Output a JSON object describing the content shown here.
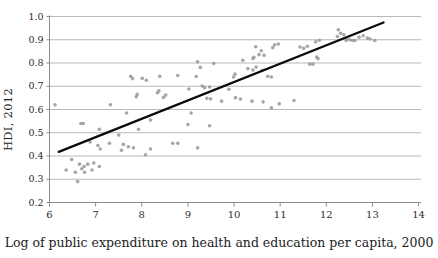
{
  "figure": {
    "background": "#ffffff",
    "text_color": "#1c1c1c"
  },
  "chart_data": {
    "type": "scatter",
    "title": "",
    "xlabel": "Log of public expenditure on health and education per capita, 2000",
    "ylabel": "HDI, 2012",
    "xlim": [
      6,
      14
    ],
    "ylim": [
      0.2,
      1.0
    ],
    "x_ticks": [
      6,
      7,
      8,
      9,
      10,
      11,
      12,
      13,
      14
    ],
    "y_ticks": [
      0.2,
      0.3,
      0.4,
      0.5,
      0.6,
      0.7,
      0.8,
      0.9,
      1.0
    ],
    "grid": "horizontal",
    "legend": "none",
    "point_color": "#9c9c9c",
    "gridline_color": "#b9b9b9",
    "axis_color": "#8c8c8c",
    "trend_color": "#0a0a0a",
    "points": [
      [
        6.12,
        0.62
      ],
      [
        6.36,
        0.34
      ],
      [
        6.48,
        0.385
      ],
      [
        6.56,
        0.33
      ],
      [
        6.61,
        0.29
      ],
      [
        6.65,
        0.365
      ],
      [
        6.7,
        0.345
      ],
      [
        6.75,
        0.355
      ],
      [
        6.76,
        0.33
      ],
      [
        6.83,
        0.365
      ],
      [
        6.92,
        0.34
      ],
      [
        6.96,
        0.37
      ],
      [
        7.08,
        0.355
      ],
      [
        6.68,
        0.54
      ],
      [
        6.73,
        0.54
      ],
      [
        6.88,
        0.46
      ],
      [
        7.05,
        0.445
      ],
      [
        7.08,
        0.515
      ],
      [
        7.1,
        0.43
      ],
      [
        7.3,
        0.455
      ],
      [
        7.5,
        0.49
      ],
      [
        7.56,
        0.425
      ],
      [
        7.6,
        0.45
      ],
      [
        7.71,
        0.44
      ],
      [
        7.82,
        0.435
      ],
      [
        7.93,
        0.515
      ],
      [
        8.08,
        0.405
      ],
      [
        8.19,
        0.555
      ],
      [
        8.19,
        0.43
      ],
      [
        8.67,
        0.455
      ],
      [
        8.78,
        0.455
      ],
      [
        9.0,
        0.535
      ],
      [
        9.07,
        0.585
      ],
      [
        9.21,
        0.435
      ],
      [
        9.47,
        0.53
      ],
      [
        7.32,
        0.62
      ],
      [
        7.67,
        0.585
      ],
      [
        7.88,
        0.655
      ],
      [
        7.9,
        0.665
      ],
      [
        8.34,
        0.672
      ],
      [
        8.37,
        0.68
      ],
      [
        8.47,
        0.652
      ],
      [
        8.52,
        0.662
      ],
      [
        9.02,
        0.688
      ],
      [
        9.41,
        0.648
      ],
      [
        9.49,
        0.645
      ],
      [
        9.73,
        0.636
      ],
      [
        9.89,
        0.687
      ],
      [
        10.03,
        0.651
      ],
      [
        10.14,
        0.645
      ],
      [
        10.39,
        0.636
      ],
      [
        10.63,
        0.633
      ],
      [
        10.81,
        0.607
      ],
      [
        10.98,
        0.624
      ],
      [
        11.3,
        0.639
      ],
      [
        7.76,
        0.743
      ],
      [
        7.8,
        0.733
      ],
      [
        8.01,
        0.734
      ],
      [
        8.1,
        0.726
      ],
      [
        8.39,
        0.743
      ],
      [
        8.78,
        0.746
      ],
      [
        9.18,
        0.742
      ],
      [
        9.31,
        0.701
      ],
      [
        9.36,
        0.694
      ],
      [
        9.47,
        0.697
      ],
      [
        9.99,
        0.74
      ],
      [
        10.02,
        0.752
      ],
      [
        9.21,
        0.805
      ],
      [
        9.27,
        0.781
      ],
      [
        9.56,
        0.798
      ],
      [
        10.19,
        0.812
      ],
      [
        10.3,
        0.776
      ],
      [
        10.41,
        0.819
      ],
      [
        10.41,
        0.77
      ],
      [
        10.48,
        0.783
      ],
      [
        10.61,
        0.769
      ],
      [
        10.73,
        0.743
      ],
      [
        10.81,
        0.74
      ],
      [
        10.43,
        0.825
      ],
      [
        10.47,
        0.87
      ],
      [
        10.54,
        0.836
      ],
      [
        10.59,
        0.853
      ],
      [
        10.65,
        0.833
      ],
      [
        10.84,
        0.866
      ],
      [
        10.88,
        0.878
      ],
      [
        10.96,
        0.882
      ],
      [
        11.43,
        0.869
      ],
      [
        11.51,
        0.863
      ],
      [
        11.59,
        0.872
      ],
      [
        11.64,
        0.795
      ],
      [
        11.71,
        0.795
      ],
      [
        11.77,
        0.891
      ],
      [
        11.79,
        0.826
      ],
      [
        11.82,
        0.819
      ],
      [
        11.85,
        0.898
      ],
      [
        12.24,
        0.914
      ],
      [
        12.26,
        0.943
      ],
      [
        12.31,
        0.928
      ],
      [
        12.38,
        0.921
      ],
      [
        12.43,
        0.897
      ],
      [
        12.44,
        0.907
      ],
      [
        12.51,
        0.9
      ],
      [
        12.57,
        0.897
      ],
      [
        12.62,
        0.897
      ],
      [
        12.71,
        0.911
      ],
      [
        12.8,
        0.917
      ],
      [
        12.89,
        0.907
      ],
      [
        12.95,
        0.903
      ],
      [
        13.05,
        0.897
      ]
    ],
    "trendline": {
      "x1": 6.2,
      "y1": 0.418,
      "x2": 13.24,
      "y2": 0.974
    }
  }
}
